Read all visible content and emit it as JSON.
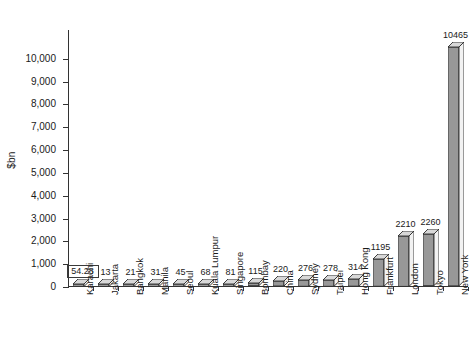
{
  "chart_data": {
    "type": "bar",
    "title": "",
    "subtitle": "",
    "xlabel": "",
    "ylabel": "$bn",
    "ylim": [
      0,
      11000
    ],
    "grid": false,
    "legend": "none",
    "style": "3d-column",
    "y_ticks": [
      "0",
      "1,000",
      "2,000",
      "3,000",
      "4,000",
      "5,000",
      "6,000",
      "7,000",
      "8,000",
      "9,000",
      "10,000"
    ],
    "y_tick_values": [
      0,
      1000,
      2000,
      3000,
      4000,
      5000,
      6000,
      7000,
      8000,
      9000,
      10000
    ],
    "categories": [
      "Karachi",
      "Jakarta",
      "Bangkok",
      "Manila",
      "Seoul",
      "Kuala Lumpur",
      "Singapore",
      "Bombay",
      "China",
      "Sydney",
      "Taipei",
      "Hong Kong",
      "Frankfurt",
      "London",
      "Tokyo",
      "New York"
    ],
    "values": [
      54.28,
      13,
      21,
      31,
      45,
      68,
      81,
      115,
      220,
      276,
      278,
      314,
      1195,
      2210,
      2260,
      10465
    ],
    "value_labels": [
      "54.28",
      "13",
      "21",
      "31",
      "45",
      "68",
      "81",
      "115",
      "220",
      "276",
      "278",
      "314",
      "1195",
      "2210",
      "2260",
      "10465"
    ],
    "boxed_labels": [
      true,
      false,
      false,
      false,
      false,
      false,
      false,
      false,
      false,
      false,
      false,
      false,
      false,
      false,
      false,
      false
    ],
    "colors": {
      "bar_front": "#989898",
      "bar_top": "#d8d8d8",
      "bar_side": "#f2f2f2",
      "bar_outline": "#2b2b2b",
      "axis": "#333333",
      "text": "#1a1a1a",
      "background": "#ffffff"
    }
  }
}
